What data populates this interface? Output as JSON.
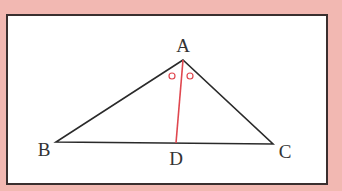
{
  "diagram": {
    "type": "triangle with angle bisector",
    "colors": {
      "background": "#f2b8b2",
      "frame_fill": "#ffffff",
      "frame_border": "#3a2f2f",
      "triangle": "#2a2a2a",
      "bisector": "#e0474f"
    },
    "labels": {
      "A": "A",
      "B": "B",
      "C": "C",
      "D": "D"
    },
    "angle_marks": "equal angles marked with small circles at A"
  }
}
